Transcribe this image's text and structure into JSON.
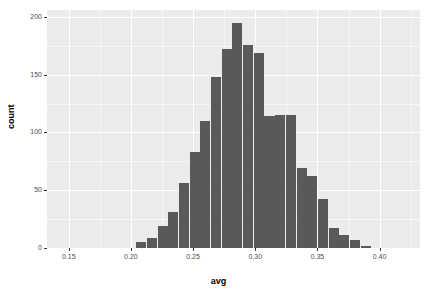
{
  "chart_data": {
    "type": "bar",
    "title": "",
    "subtitle": "",
    "xlabel": "avg",
    "ylabel": "count",
    "xlim": [
      0.1325,
      0.4325
    ],
    "ylim": [
      0,
      206
    ],
    "grid": true,
    "legend": null,
    "legend_position": "none",
    "bar_color": "#595959",
    "panel_background": "#ebebeb",
    "gridline_color": "#ffffff",
    "binwidth": 0.0086,
    "x_ticks": [
      0.15,
      0.2,
      0.25,
      0.3,
      0.35,
      0.4
    ],
    "x_tick_labels": [
      "0.15",
      "0.20",
      "0.25",
      "0.30",
      "0.35",
      "0.40"
    ],
    "x_minor_ticks": [
      0.175,
      0.225,
      0.275,
      0.325,
      0.375,
      0.425
    ],
    "y_ticks": [
      0,
      50,
      100,
      150,
      200
    ],
    "y_tick_labels": [
      "0",
      "50",
      "100",
      "150",
      "200"
    ],
    "y_minor_ticks": [
      25,
      75,
      125,
      175
    ],
    "bin_centers": [
      0.2085,
      0.2171,
      0.2257,
      0.2343,
      0.2429,
      0.2515,
      0.2601,
      0.2687,
      0.2773,
      0.2859,
      0.2945,
      0.3031,
      0.3117,
      0.3203,
      0.3289,
      0.3375,
      0.3461,
      0.3547,
      0.3633,
      0.3719,
      0.3805,
      0.3891
    ],
    "values": [
      5,
      9,
      19,
      31,
      56,
      83,
      110,
      148,
      172,
      195,
      176,
      169,
      114,
      115,
      115,
      69,
      62,
      42,
      17,
      11,
      7,
      2
    ],
    "categories": [
      "0.2085",
      "0.2171",
      "0.2257",
      "0.2343",
      "0.2429",
      "0.2515",
      "0.2601",
      "0.2687",
      "0.2773",
      "0.2859",
      "0.2945",
      "0.3031",
      "0.3117",
      "0.3203",
      "0.3289",
      "0.3375",
      "0.3461",
      "0.3547",
      "0.3633",
      "0.3719",
      "0.3805",
      "0.3891"
    ]
  }
}
